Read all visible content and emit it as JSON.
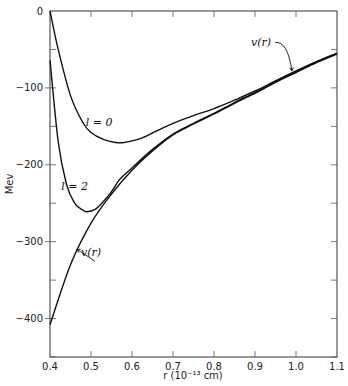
{
  "chart_data": {
    "type": "line",
    "title": "",
    "xlabel": "r (10⁻¹³ cm)",
    "ylabel": "Mev",
    "xlim": [
      0.4,
      1.1
    ],
    "ylim": [
      -450,
      0
    ],
    "xticks": [
      0.4,
      0.5,
      0.6,
      0.7,
      0.8,
      0.9,
      1.0,
      1.1
    ],
    "xtick_labels": [
      "0.4",
      "0.5",
      "0.6",
      "0.7",
      "0.8",
      "0.9",
      "1.0",
      "1.1"
    ],
    "yticks": [
      0,
      -100,
      -200,
      -300,
      -400
    ],
    "ytick_labels": [
      "0",
      "−100",
      "−200",
      "−300",
      "−400"
    ],
    "grid": false,
    "legend": "none (inline curve labels)",
    "series": [
      {
        "name": "v(r)",
        "x": [
          0.4,
          0.45,
          0.5,
          0.55,
          0.6,
          0.65,
          0.7,
          0.75,
          0.8,
          0.85,
          0.9,
          0.95,
          1.0,
          1.05,
          1.1
        ],
        "y": [
          -408,
          -330,
          -276,
          -238,
          -207,
          -182,
          -161,
          -147,
          -134,
          -120,
          -107,
          -93,
          -80,
          -67,
          -56
        ]
      },
      {
        "name": "l = 0",
        "x": [
          0.4,
          0.42,
          0.45,
          0.48,
          0.5,
          0.53,
          0.56,
          0.58,
          0.62,
          0.66,
          0.7,
          0.75,
          0.8,
          0.85,
          0.9,
          0.95,
          1.0,
          1.05,
          1.1
        ],
        "y": [
          0,
          -50,
          -110,
          -145,
          -158,
          -167,
          -171,
          -171,
          -166,
          -156,
          -146,
          -136,
          -127,
          -116,
          -104,
          -91,
          -78,
          -66,
          -55
        ]
      },
      {
        "name": "l = 2",
        "x": [
          0.4,
          0.42,
          0.44,
          0.46,
          0.48,
          0.49,
          0.51,
          0.53,
          0.55,
          0.57,
          0.6,
          0.65,
          0.7,
          0.75,
          0.8,
          0.85,
          0.9,
          0.95,
          1.0,
          1.05,
          1.1
        ],
        "y": [
          -64,
          -170,
          -225,
          -250,
          -259,
          -261,
          -258,
          -248,
          -235,
          -219,
          -204,
          -180,
          -160,
          -146,
          -133,
          -119,
          -106,
          -92,
          -79,
          -66,
          -55
        ]
      }
    ],
    "annotations": [
      {
        "text": "l = 0",
        "x": 0.52,
        "y": -150
      },
      {
        "text": "l = 2",
        "x": 0.46,
        "y": -233
      },
      {
        "text": "v(r)",
        "x": 0.915,
        "y": -45,
        "arrow_to": {
          "x": 0.99,
          "y": -78
        }
      },
      {
        "text": "v(r)",
        "x": 0.5,
        "y": -318,
        "arrow_to": {
          "x": 0.465,
          "y": -310
        }
      }
    ]
  },
  "labels": {
    "xlabel": "r (10⁻¹³ cm)",
    "ylabel": "Mev",
    "l0": "l = 0",
    "l2": "l = 2",
    "vr_top": "v(r)",
    "vr_bottom": "v(r)"
  }
}
